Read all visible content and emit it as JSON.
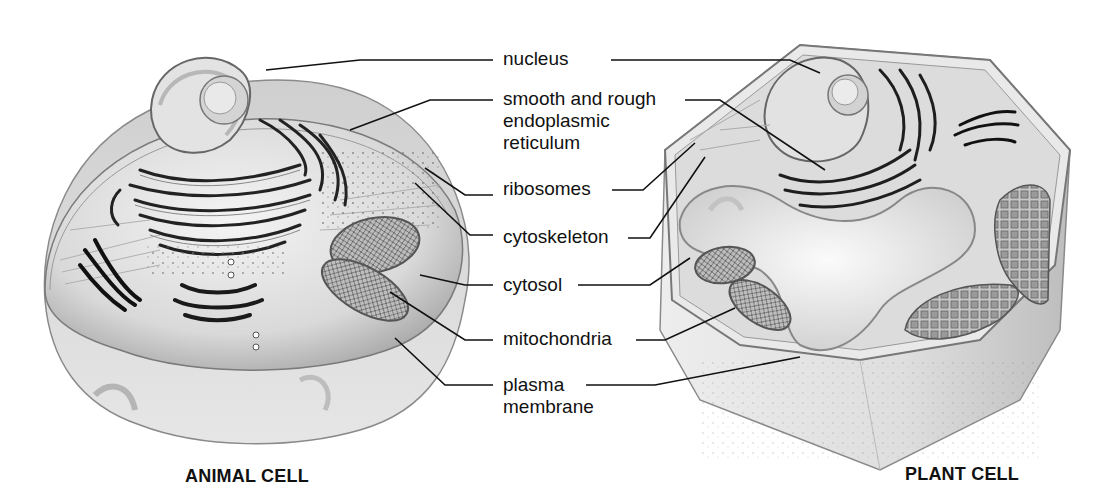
{
  "figure": {
    "type": "comparative cell diagram",
    "cells": [
      {
        "id": "animal",
        "caption": "ANIMAL CELL"
      },
      {
        "id": "plant",
        "caption": "PLANT CELL"
      }
    ],
    "labels": [
      {
        "id": "nucleus",
        "lines": [
          "nucleus"
        ]
      },
      {
        "id": "er",
        "lines": [
          "smooth and rough",
          "endoplasmic",
          "reticulum"
        ]
      },
      {
        "id": "ribosomes",
        "lines": [
          "ribosomes"
        ]
      },
      {
        "id": "cytoskeleton",
        "lines": [
          "cytoskeleton"
        ]
      },
      {
        "id": "cytosol",
        "lines": [
          "cytosol"
        ]
      },
      {
        "id": "mitochondria",
        "lines": [
          "mitochondria"
        ]
      },
      {
        "id": "plasma-membrane",
        "lines": [
          "plasma",
          "membrane"
        ]
      }
    ],
    "colors": {
      "ink": "#111111",
      "background": "#ffffff",
      "cell_fill": "#dcdcdc",
      "cell_shadow": "#a8a8a8"
    }
  }
}
